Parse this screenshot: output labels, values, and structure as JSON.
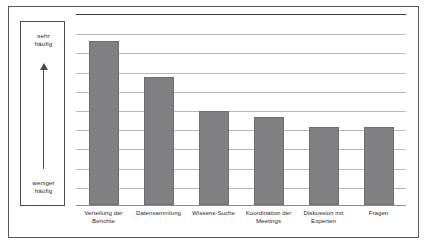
{
  "scale": {
    "top_label": "sehr\nhäufig",
    "top_label_line1": "sehr",
    "top_label_line2": "häufig",
    "bottom_label_line1": "weniger",
    "bottom_label_line2": "häufig",
    "arrow_direction": "up"
  },
  "chart_data": {
    "type": "bar",
    "title": "",
    "subtitle": "",
    "xlabel": "",
    "ylabel": "",
    "categories": [
      "Verteilung der Berichte",
      "Datensammlung",
      "Wissens-Suche",
      "Koordination der Meetings",
      "Diskussion mit Experten",
      "Fragen"
    ],
    "category_lines": [
      [
        "Verteilung der",
        "Berichte"
      ],
      [
        "Datensammlung",
        ""
      ],
      [
        "Wissens-Suche",
        ""
      ],
      [
        "Koordination der",
        "Meetings"
      ],
      [
        "Diskussion mit",
        "Experten"
      ],
      [
        "Fragen",
        ""
      ]
    ],
    "values": [
      85.4,
      66.7,
      48.9,
      45.8,
      40.6,
      40.6
    ],
    "ylim": [
      0,
      100
    ],
    "grid": true,
    "gridline_count": 9,
    "legend": "none",
    "legend_position": "none",
    "bar_color": "#808082",
    "bar_edge_color": "#6e6e70",
    "axis_color": "#3a3a3c",
    "grid_color": "#b9b9bb",
    "annotations": [
      "sehr häufig",
      "weniger häufig"
    ]
  }
}
